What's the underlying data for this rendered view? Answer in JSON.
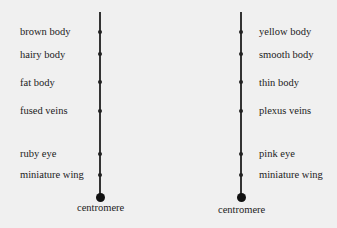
{
  "left_chromosome": {
    "labels": [
      "brown body",
      "hairy body",
      "fat body",
      "fused veins",
      "ruby eye",
      "miniature wing"
    ],
    "centromere_label": "centromere"
  },
  "right_chromosome": {
    "labels": [
      "yellow body",
      "smooth body",
      "thin body",
      "plexus veins",
      "pink eye",
      "miniature wing"
    ],
    "centromere_label": "centromere"
  }
}
